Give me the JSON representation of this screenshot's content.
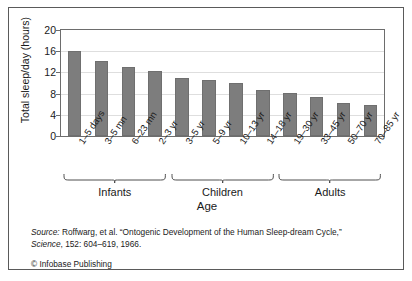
{
  "chart_data": {
    "type": "bar",
    "title": "",
    "xlabel": "Age",
    "ylabel": "Total sleep/day (hours)",
    "ylim": [
      0,
      20
    ],
    "yticks": [
      0,
      4,
      8,
      12,
      16,
      20
    ],
    "grid": true,
    "legend": "none",
    "bar_color": "#7d7d7d",
    "categories": [
      "1–5 days",
      "3–5 mn",
      "6–23 mn",
      "2–3 yr",
      "3–5 yr",
      "5–9 yr",
      "10–13 yr",
      "14–18 yr",
      "19–30 yr",
      "33–45 yr",
      "50–70 yr",
      "70–85 yr"
    ],
    "values": [
      16.1,
      14.1,
      13.1,
      12.2,
      11.0,
      10.5,
      10.0,
      8.6,
      8.1,
      7.3,
      6.2,
      5.8
    ],
    "groups": [
      {
        "label": "Infants",
        "start": 0,
        "end": 3
      },
      {
        "label": "Children",
        "start": 4,
        "end": 7
      },
      {
        "label": "Adults",
        "start": 8,
        "end": 11
      }
    ]
  },
  "caption": {
    "source_prefix": "Source:",
    "source_text": " Roffwarg, et al. “Ontogenic Development of the Human Sleep-dream Cycle,”",
    "journal": "Science",
    "journal_detail": ", 152: 604–619, 1966.",
    "copyright": "© Infobase Publishing"
  }
}
